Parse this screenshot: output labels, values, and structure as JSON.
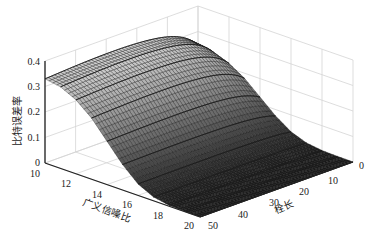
{
  "chart_data": {
    "type": "surface3d",
    "title": "",
    "zlabel": "比特误差率",
    "xlabel": "广义信噪比",
    "ylabel": "栓长",
    "x_ticks": [
      10,
      12,
      14,
      16,
      18,
      20
    ],
    "y_ticks": [
      0,
      10,
      20,
      30,
      40,
      50
    ],
    "z_ticks": [
      0,
      0.1,
      0.2,
      0.3,
      0.4
    ],
    "xlim": [
      10,
      20
    ],
    "ylim": [
      0,
      50
    ],
    "zlim": [
      0,
      0.4
    ],
    "grid": true,
    "colormap": "gray",
    "x": [
      10,
      10.5,
      11,
      11.5,
      12,
      12.5,
      13,
      13.5,
      14,
      14.5,
      15,
      15.5,
      16,
      16.5,
      17,
      17.5,
      18,
      18.5,
      19,
      19.5,
      20
    ],
    "y": [
      0,
      5,
      10,
      15,
      20,
      25,
      30,
      35,
      40,
      45,
      50
    ],
    "z_description": "BER ≈ 0.32–0.34 at SNR 10, decreasing smoothly (sigmoid-like) to ≈0 at SNR ≥ 17; nearly constant along 栓长 with slight drop near 0",
    "z_at_x": {
      "10": 0.33,
      "11": 0.32,
      "12": 0.29,
      "13": 0.24,
      "14": 0.17,
      "15": 0.1,
      "16": 0.045,
      "17": 0.015,
      "18": 0.004,
      "19": 0.001,
      "20": 0.0
    }
  },
  "axes": {
    "z_labels": [
      "0",
      "0.1",
      "0.2",
      "0.3",
      "0.4"
    ],
    "x_labels": [
      "10",
      "12",
      "14",
      "16",
      "18",
      "20"
    ],
    "y_labels": [
      "0",
      "10",
      "20",
      "30",
      "40",
      "50"
    ],
    "zlabel": "比特误差率",
    "xlabel": "广义信噪比",
    "ylabel": "栓长"
  }
}
